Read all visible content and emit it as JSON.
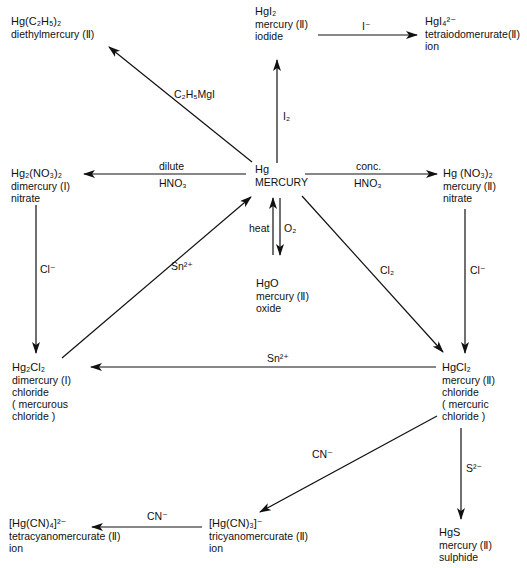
{
  "diagram": {
    "nodes": {
      "hg": {
        "formula": "Hg",
        "name": "MERCURY"
      },
      "hgi2": {
        "formula": "HgI₂",
        "lines": [
          "mercury (Ⅱ)",
          "iodide"
        ]
      },
      "hgi4": {
        "formula": "HgI₄²⁻",
        "lines": [
          "tetraiodomerurate(Ⅱ)",
          "ion"
        ]
      },
      "hget2": {
        "formula": "Hg(C₂H₅)₂",
        "lines": [
          "diethylmercury (Ⅱ)"
        ]
      },
      "hg2no3": {
        "formula": "Hg₂(NO₃)₂",
        "lines": [
          "dimercury (Ⅰ)",
          "nitrate"
        ]
      },
      "hgno3": {
        "formula": "Hg (NO₃)₂",
        "lines": [
          "mercury (Ⅱ)",
          "nitrate"
        ]
      },
      "hgo": {
        "formula": "HgO",
        "lines": [
          "mercury (Ⅱ)",
          "oxide"
        ]
      },
      "hg2cl2": {
        "formula": "Hg₂Cl₂",
        "lines": [
          "dimercury (Ⅰ)",
          "chloride",
          "( mercurous",
          "chloride )"
        ]
      },
      "hgcl2": {
        "formula": "HgCl₂",
        "lines": [
          "mercury (Ⅱ)",
          "chloride",
          "( mercuric",
          "chloride )"
        ]
      },
      "hgcn4": {
        "formula": "[Hg(CN)₄]²⁻",
        "lines": [
          "tetracyanomercurate (Ⅱ)",
          "ion"
        ]
      },
      "hgcn3": {
        "formula": "[Hg(CN)₃]⁻",
        "lines": [
          "tricyanomercurate (Ⅱ)",
          "ion"
        ]
      },
      "hgs": {
        "formula": "HgS",
        "lines": [
          "mercury (Ⅱ)",
          "sulphide"
        ]
      }
    },
    "edges": [
      {
        "from": "hg",
        "to": "hgi2",
        "label": "I₂"
      },
      {
        "from": "hgi2",
        "to": "hgi4",
        "label": "I⁻"
      },
      {
        "from": "hg",
        "to": "hget2",
        "label": "C₂H₅MgI"
      },
      {
        "from": "hg",
        "to": "hg2no3",
        "label_top": "dilute",
        "label_bottom": "HNO₃"
      },
      {
        "from": "hg",
        "to": "hgno3",
        "label_top": "conc.",
        "label_bottom": "HNO₃"
      },
      {
        "from": "hg",
        "to": "hgo",
        "label": "O₂"
      },
      {
        "from": "hgo",
        "to": "hg",
        "label": "heat"
      },
      {
        "from": "hg2no3",
        "to": "hg2cl2",
        "label": "Cl⁻"
      },
      {
        "from": "hg2cl2",
        "to": "hg",
        "label": "Sn²⁺"
      },
      {
        "from": "hg",
        "to": "hgcl2",
        "label": "Cl₂"
      },
      {
        "from": "hgno3",
        "to": "hgcl2",
        "label": "Cl⁻"
      },
      {
        "from": "hgcl2",
        "to": "hg2cl2",
        "label": "Sn²⁺"
      },
      {
        "from": "hgcl2",
        "to": "hgcn3",
        "label": "CN⁻"
      },
      {
        "from": "hgcn3",
        "to": "hgcn4",
        "label": "CN⁻"
      },
      {
        "from": "hgcl2",
        "to": "hgs",
        "label": "S²⁻"
      }
    ]
  }
}
